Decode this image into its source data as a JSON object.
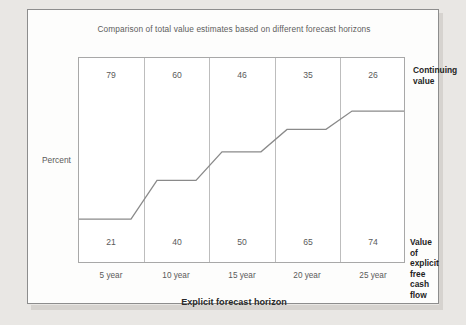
{
  "chart": {
    "title": "Comparison of total value estimates based on different forecast horizons",
    "ylabel": "Percent",
    "xlabel": "Explicit forecast horizon",
    "legend_top": "Continuing\nvalue",
    "legend_top_line1": "Continuing",
    "legend_top_line2": "value",
    "legend_bottom_line1": "Value of explicit",
    "legend_bottom_line2": "free cash flow"
  },
  "chart_data": {
    "type": "area",
    "title": "Comparison of total value estimates based on different forecast horizons",
    "xlabel": "Explicit forecast horizon",
    "ylabel": "Percent",
    "categories": [
      "5 year",
      "10 year",
      "15 year",
      "20 year",
      "25 year"
    ],
    "ylim": [
      0,
      100
    ],
    "grid": false,
    "legend_position": "right",
    "series": [
      {
        "name": "Continuing value",
        "values": [
          79,
          60,
          46,
          35,
          26
        ]
      },
      {
        "name": "Value of explicit free cash flow",
        "values": [
          21,
          40,
          50,
          65,
          74
        ]
      }
    ],
    "annotations": [
      {
        "label": "79",
        "category": "5 year",
        "series": "Continuing value"
      },
      {
        "label": "60",
        "category": "10 year",
        "series": "Continuing value"
      },
      {
        "label": "46",
        "category": "15 year",
        "series": "Continuing value"
      },
      {
        "label": "35",
        "category": "20 year",
        "series": "Continuing value"
      },
      {
        "label": "26",
        "category": "25 year",
        "series": "Continuing value"
      },
      {
        "label": "21",
        "category": "5 year",
        "series": "Value of explicit free cash flow"
      },
      {
        "label": "40",
        "category": "10 year",
        "series": "Value of explicit free cash flow"
      },
      {
        "label": "50",
        "category": "15 year",
        "series": "Value of explicit free cash flow"
      },
      {
        "label": "65",
        "category": "20 year",
        "series": "Value of explicit free cash flow"
      },
      {
        "label": "74",
        "category": "25 year",
        "series": "Value of explicit free cash flow"
      }
    ],
    "top_values": [
      "79",
      "60",
      "46",
      "35",
      "26"
    ],
    "bottom_values": [
      "21",
      "40",
      "50",
      "65",
      "74"
    ],
    "colors": {
      "line": "#8a8a8a",
      "frame": "#a8a8a8",
      "divider": "#bdbdbd",
      "text": "#5a5a5a",
      "bold_text": "#1f1f1f"
    }
  },
  "ticks": {
    "x": [
      "5 year",
      "10 year",
      "15 year",
      "20 year",
      "25 year"
    ]
  }
}
